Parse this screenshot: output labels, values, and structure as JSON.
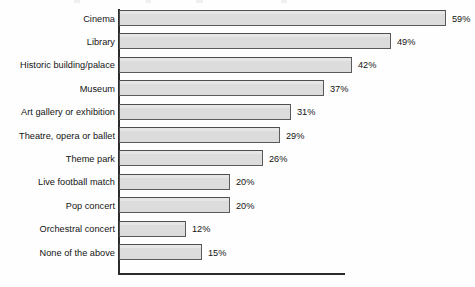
{
  "chart_data": {
    "type": "bar",
    "orientation": "horizontal",
    "title": "",
    "xlabel": "",
    "ylabel": "",
    "xlim": [
      0,
      59
    ],
    "grid": false,
    "legend": null,
    "value_suffix": "%",
    "categories": [
      "Cinema",
      "Library",
      "Historic building/palace",
      "Museum",
      "Art gallery or exhibition",
      "Theatre, opera or ballet",
      "Theme park",
      "Live football match",
      "Pop concert",
      "Orchestral concert",
      "None of the above"
    ],
    "values": [
      59,
      49,
      42,
      37,
      31,
      29,
      26,
      20,
      20,
      12,
      15
    ],
    "value_labels": [
      "59%",
      "49%",
      "42%",
      "37%",
      "31%",
      "29%",
      "26%",
      "20%",
      "20%",
      "12%",
      "15%"
    ],
    "colors": {
      "bar_fill": "#dcdcdc",
      "bar_border": "#5a5a5a",
      "axis": "#2b2b2b",
      "text": "#141414",
      "background": "#fefefe"
    }
  }
}
